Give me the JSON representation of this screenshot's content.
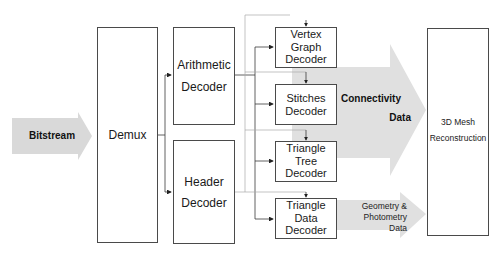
{
  "diagram": {
    "type": "block-diagram",
    "input": {
      "label": "Bitstream"
    },
    "demux": {
      "label": "Demux"
    },
    "stage1": [
      {
        "label_line1": "Arithmetic",
        "label_line2": "Decoder"
      },
      {
        "label_line1": "Header",
        "label_line2": "Decoder"
      }
    ],
    "stage2": [
      {
        "lines": [
          "Vertex",
          "Graph",
          "Decoder"
        ]
      },
      {
        "lines": [
          "Stitches",
          "Decoder"
        ]
      },
      {
        "lines": [
          "Triangle",
          "Tree",
          "Decoder"
        ]
      },
      {
        "lines": [
          "Triangle",
          "Data",
          "Decoder"
        ]
      }
    ],
    "flows": {
      "connectivity": {
        "line1": "Connectivity",
        "line2": "Data"
      },
      "geometry": {
        "line1": "Geometry &",
        "line2": "Photometry",
        "line3": "Data"
      }
    },
    "output": {
      "line1": "3D Mesh",
      "line2": "Reconstruction"
    },
    "colors": {
      "box_border": "#4a4a4a",
      "arrow_fill": "#d9d9d9",
      "line": "#3a3a3a"
    }
  }
}
